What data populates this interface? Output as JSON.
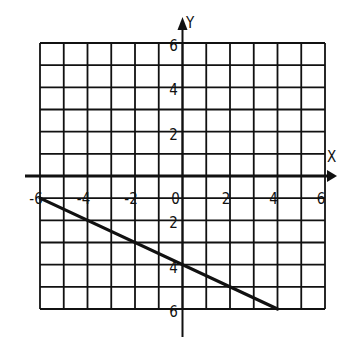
{
  "chart_data": {
    "type": "line",
    "title": "",
    "xlabel": "X",
    "ylabel": "Y",
    "xlim": [
      -6,
      6
    ],
    "ylim": [
      -6,
      6
    ],
    "grid": true,
    "grid_step": 1,
    "x_tick_labels": [
      "-6",
      "-4",
      "-2",
      "0",
      "2",
      "4",
      "6"
    ],
    "x_ticks": [
      -6,
      -4,
      -2,
      0,
      2,
      4,
      6
    ],
    "y_tick_labels": [
      "6",
      "4",
      "2",
      "2",
      "4",
      "6"
    ],
    "y_ticks": [
      6,
      4,
      2,
      -2,
      -4,
      -6
    ],
    "series": [
      {
        "name": "line",
        "x": [
          -6,
          4
        ],
        "y": [
          -1,
          -6
        ],
        "slope": -0.5,
        "y_intercept": -4
      }
    ],
    "legend": null
  },
  "axes": {
    "x_label": "X",
    "y_label": "Y",
    "origin_label": "0"
  },
  "colors": {
    "ink": "#111111",
    "background": "#ffffff"
  }
}
